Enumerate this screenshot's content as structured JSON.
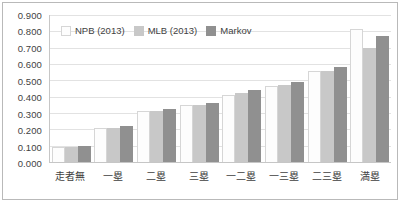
{
  "chart_data": {
    "type": "bar",
    "title": "",
    "subtitle": "",
    "xlabel": "",
    "ylabel": "",
    "ylim": [
      0.0,
      0.9
    ],
    "grid": true,
    "legend_position": "top-left-inside",
    "categories": [
      "走者無",
      "一塁",
      "二塁",
      "三塁",
      "一二塁",
      "一三塁",
      "二三塁",
      "満塁"
    ],
    "ytick_labels": [
      "0.900",
      "0.800",
      "0.700",
      "0.600",
      "0.500",
      "0.400",
      "0.300",
      "0.200",
      "0.100",
      "0.000"
    ],
    "ytick_values": [
      0.9,
      0.8,
      0.7,
      0.6,
      0.5,
      0.4,
      0.3,
      0.2,
      0.1,
      0.0
    ],
    "series": [
      {
        "name": "NPB (2013)",
        "color": "#fdfdfd",
        "values": [
          0.09,
          0.208,
          0.31,
          0.35,
          0.412,
          0.468,
          0.558,
          0.812
        ]
      },
      {
        "name": "MLB (2013)",
        "color": "#c8c8c8",
        "values": [
          0.09,
          0.21,
          0.31,
          0.352,
          0.42,
          0.47,
          0.56,
          0.698
        ]
      },
      {
        "name": "Markov",
        "color": "#909090",
        "values": [
          0.1,
          0.222,
          0.322,
          0.362,
          0.442,
          0.49,
          0.58,
          0.772
        ]
      }
    ]
  },
  "legend": {
    "items": [
      {
        "label": "NPB (2013)",
        "swatch": "legend-swatch-npb"
      },
      {
        "label": "MLB (2013)",
        "swatch": "legend-swatch-mlb"
      },
      {
        "label": "Markov",
        "swatch": "legend-swatch-markov"
      }
    ]
  },
  "colors": {
    "series_npb": "#fdfdfd",
    "series_mlb": "#c8c8c8",
    "series_markov": "#909090",
    "gridline": "#e2e2e2",
    "axis": "#c6c6c6",
    "frame": "#b9b9b9",
    "text": "#3f3f3f",
    "background": "#ffffff"
  }
}
